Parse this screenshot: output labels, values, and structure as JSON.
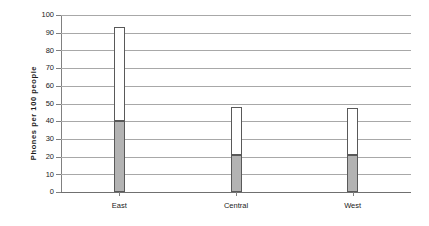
{
  "chart_data": {
    "type": "bar",
    "title": "",
    "subtitle": "",
    "xlabel": "",
    "ylabel": "Phones per  100  people",
    "categories": [
      "East",
      "Central",
      "West"
    ],
    "series": [
      {
        "name": "lower-segment",
        "color": "#b3b3b3",
        "values": [
          40,
          21,
          21
        ]
      },
      {
        "name": "upper-segment",
        "color": "#ffffff",
        "values": [
          53,
          27,
          26.5
        ]
      }
    ],
    "totals": [
      93,
      48,
      47.5
    ],
    "stacked": true,
    "ylim": [
      0,
      100
    ],
    "ytick_labels": [
      "100",
      "90",
      "80",
      "70",
      "60",
      "50",
      "40",
      "30",
      "20",
      "10",
      "0"
    ],
    "ytick_values": [
      100,
      90,
      80,
      70,
      60,
      50,
      40,
      30,
      20,
      10,
      0
    ],
    "ytick_step": 10,
    "grid": true,
    "grid_axis": "y",
    "legend": false,
    "legend_position": "none",
    "annotations": [],
    "colors": {
      "lower_fill": "#b3b3b3",
      "upper_fill": "#ffffff",
      "bar_outline": "#595959",
      "gridline": "#a8a8a8",
      "axis": "#808080",
      "text": "#1a1a1a",
      "background": "#ffffff"
    }
  }
}
